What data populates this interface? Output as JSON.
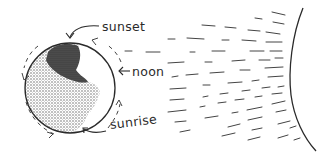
{
  "figure": {
    "labels": {
      "sunset": "sunset",
      "noon": "noon",
      "sunrise": "sunrise"
    },
    "elements": {
      "earth": "earth-globe",
      "sun": "sun-edge",
      "rays": "sunlight-rays",
      "rotation": "counterclockwise-rotation-arrows"
    },
    "colors": {
      "ink": "#2a2a2a",
      "background": "#ffffff"
    }
  }
}
